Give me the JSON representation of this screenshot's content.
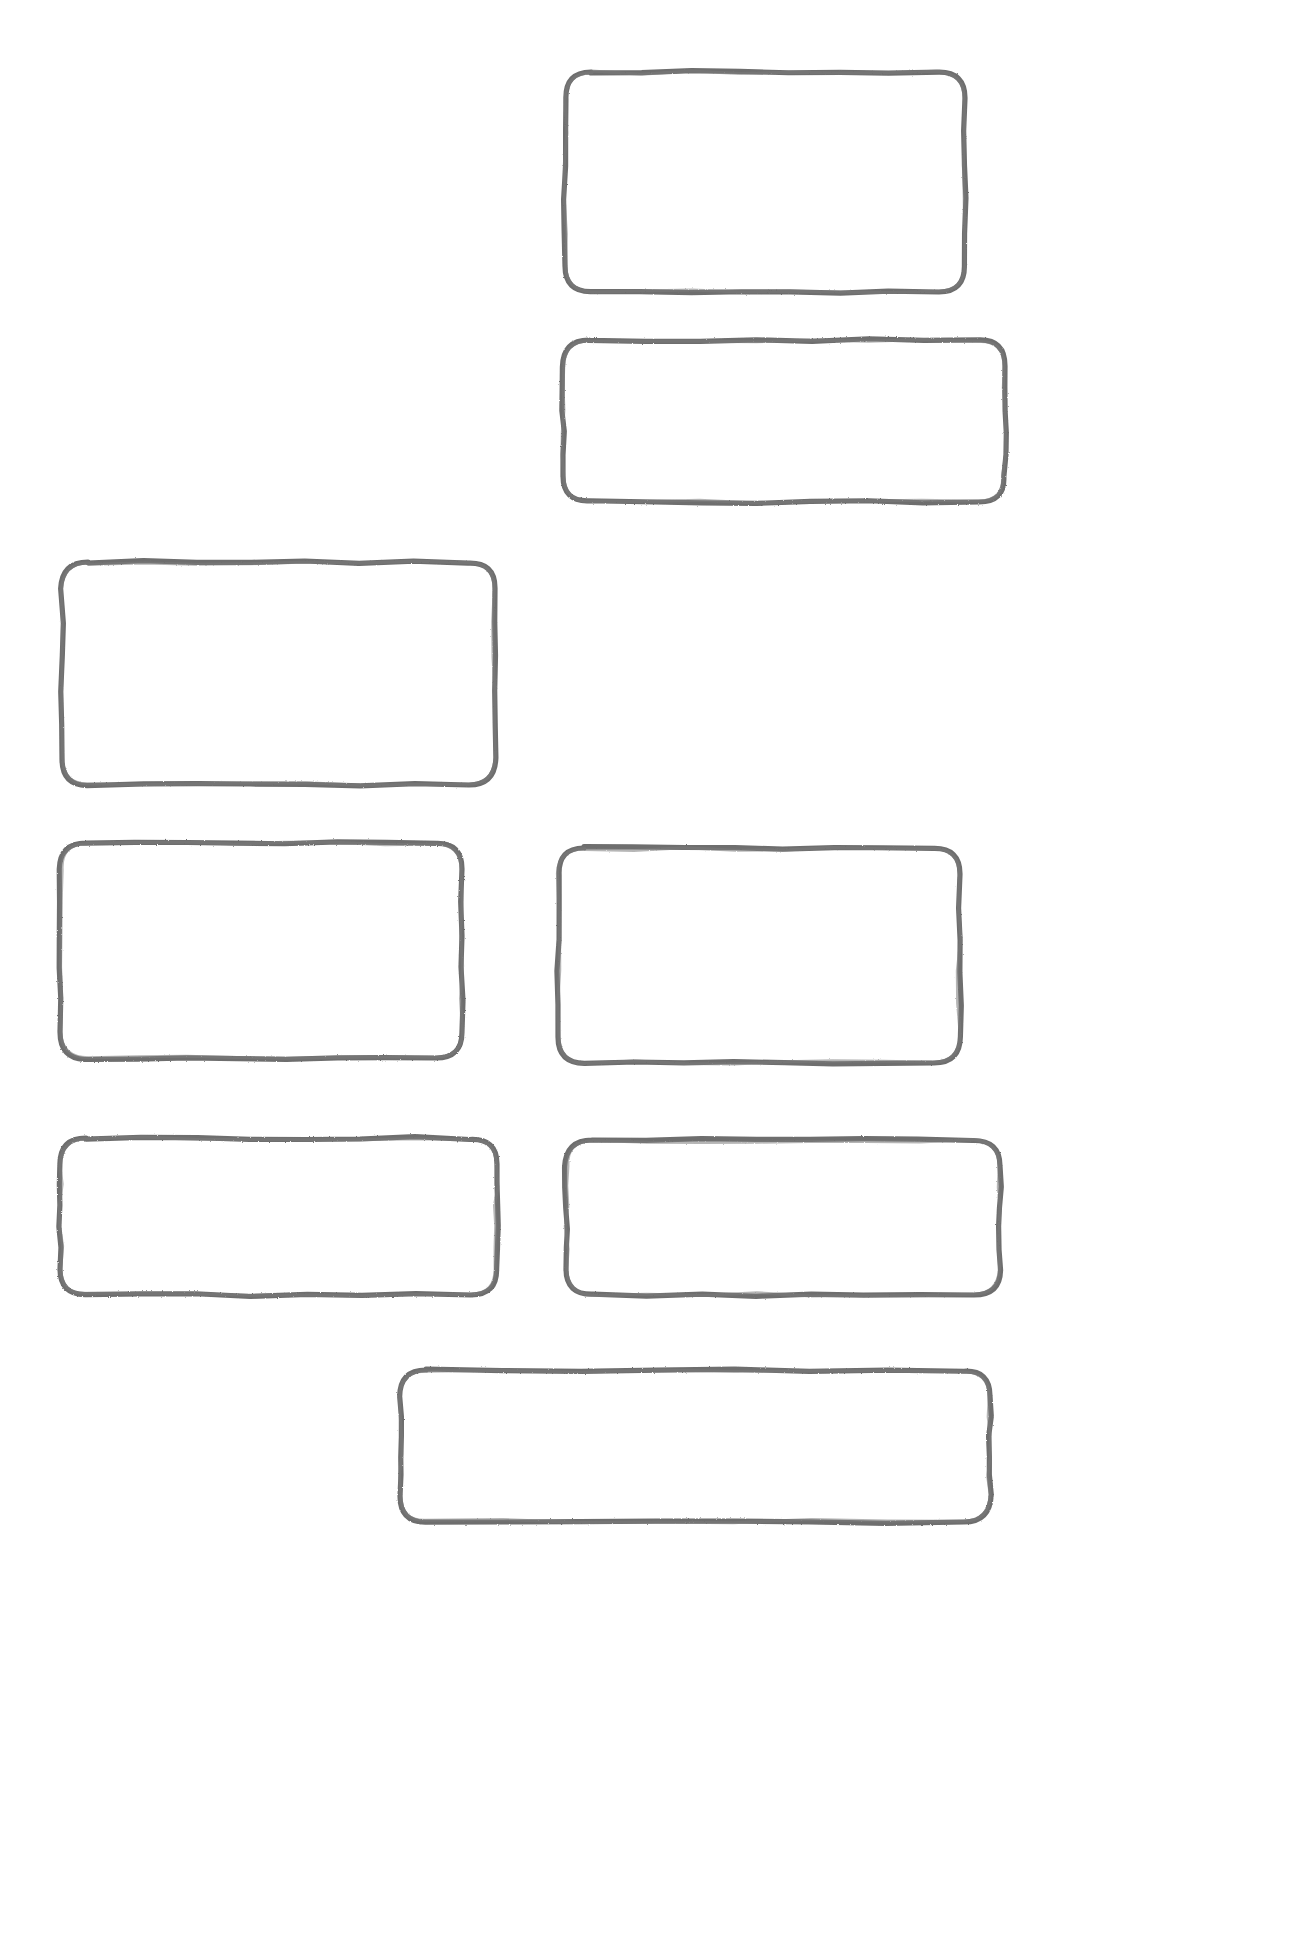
{
  "page": {
    "background_color": "#ffffff",
    "width": 1309,
    "height": 1946
  },
  "style": {
    "stroke_color": "#6e6e6e",
    "stroke_width": 5.2,
    "corner_radius": 26,
    "fill": "none",
    "look": "hand-drawn sketch, rough pencil stroke"
  },
  "boxes": [
    {
      "id": "box-1",
      "label": "",
      "row": 1,
      "column": "right",
      "x": 565,
      "y": 72,
      "width": 400,
      "height": 220,
      "radius": 26
    },
    {
      "id": "box-2",
      "label": "",
      "row": 2,
      "column": "right",
      "x": 563,
      "y": 340,
      "width": 442,
      "height": 162,
      "radius": 26
    },
    {
      "id": "box-3",
      "label": "",
      "row": 3,
      "column": "left",
      "x": 62,
      "y": 562,
      "width": 433,
      "height": 223,
      "radius": 26
    },
    {
      "id": "box-4",
      "label": "",
      "row": 4,
      "column": "left",
      "x": 60,
      "y": 843,
      "width": 402,
      "height": 215,
      "radius": 26
    },
    {
      "id": "box-5",
      "label": "",
      "row": 4,
      "column": "right",
      "x": 558,
      "y": 848,
      "width": 402,
      "height": 215,
      "radius": 26
    },
    {
      "id": "box-6",
      "label": "",
      "row": 5,
      "column": "left",
      "x": 60,
      "y": 1138,
      "width": 437,
      "height": 157,
      "radius": 26
    },
    {
      "id": "box-7",
      "label": "",
      "row": 5,
      "column": "right",
      "x": 566,
      "y": 1140,
      "width": 434,
      "height": 155,
      "radius": 26
    },
    {
      "id": "box-8",
      "label": "",
      "row": 6,
      "column": "center",
      "x": 400,
      "y": 1370,
      "width": 590,
      "height": 152,
      "radius": 26
    }
  ],
  "counts": {
    "total_boxes": 8
  }
}
